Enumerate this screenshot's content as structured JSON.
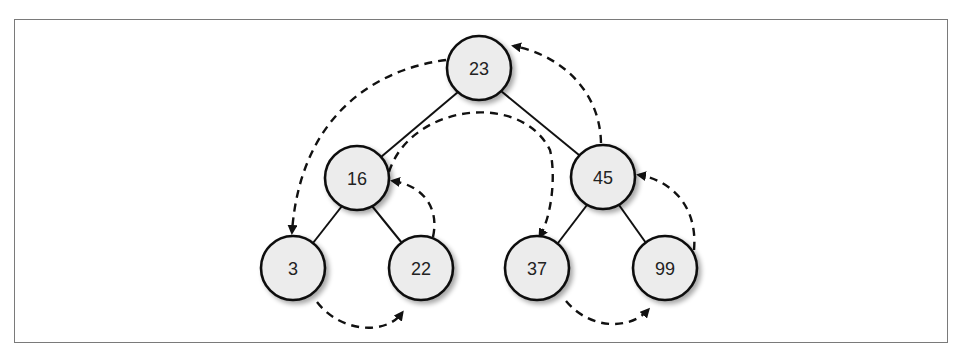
{
  "diagram": {
    "type": "binary-search-tree-traversal",
    "nodes": [
      {
        "id": "n23",
        "label": "23",
        "x": 479,
        "y": 68
      },
      {
        "id": "n16",
        "label": "16",
        "x": 357,
        "y": 178
      },
      {
        "id": "n45",
        "label": "45",
        "x": 603,
        "y": 177
      },
      {
        "id": "n3",
        "label": "3",
        "x": 293,
        "y": 268
      },
      {
        "id": "n22",
        "label": "22",
        "x": 421,
        "y": 268
      },
      {
        "id": "n37",
        "label": "37",
        "x": 537,
        "y": 268
      },
      {
        "id": "n99",
        "label": "99",
        "x": 665,
        "y": 268
      }
    ],
    "edges": [
      {
        "from": "23",
        "to": "16"
      },
      {
        "from": "23",
        "to": "45"
      },
      {
        "from": "16",
        "to": "3"
      },
      {
        "from": "16",
        "to": "22"
      },
      {
        "from": "45",
        "to": "37"
      },
      {
        "from": "45",
        "to": "99"
      }
    ],
    "traversal_arrows": [
      {
        "from": "23",
        "to": "3"
      },
      {
        "from": "3",
        "to": "22"
      },
      {
        "from": "22",
        "to": "16"
      },
      {
        "from": "16",
        "to": "37"
      },
      {
        "from": "37",
        "to": "99"
      },
      {
        "from": "99",
        "to": "45"
      },
      {
        "from": "45",
        "to": "23"
      }
    ],
    "colors": {
      "node_fill": "#ececec",
      "stroke": "#111111",
      "frame": "#7a7a7a"
    }
  }
}
